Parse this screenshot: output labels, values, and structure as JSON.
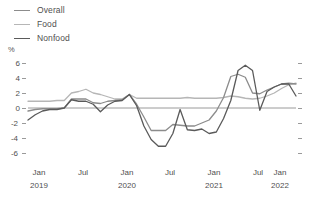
{
  "legend": {
    "position": "top-left",
    "items": [
      {
        "label": "Overall",
        "color": "#8c8c8c"
      },
      {
        "label": "Food",
        "color": "#b6b6b6"
      },
      {
        "label": "Nonfood",
        "color": "#5a5a5a"
      }
    ]
  },
  "axes": {
    "y_unit_label": "%",
    "y_ticks": [
      "6",
      "4",
      "2",
      "0",
      "-2",
      "-4",
      "-6"
    ],
    "y_tick_values": [
      6,
      4,
      2,
      0,
      -2,
      -4,
      -6
    ],
    "x_months": [
      "Jan",
      "Jul",
      "Jan",
      "Jul",
      "Jan",
      "Jul",
      "Jan"
    ],
    "x_years": [
      "2019",
      "",
      "2020",
      "",
      "2021",
      "",
      "2022"
    ]
  },
  "colors": {
    "overall": "#8c8c8c",
    "food": "#b6b6b6",
    "nonfood": "#5a5a5a",
    "axis": "#9a9a9a",
    "zero": "#9a9a9a",
    "text": "#4f4f4f"
  },
  "chart_data": {
    "type": "line",
    "title": "",
    "subtitle": "",
    "xlabel": "",
    "ylabel": "%",
    "ylim": [
      -6.6,
      6.6
    ],
    "grid": false,
    "legend_position": "top-left",
    "annotations": [],
    "x": [
      "2019-01",
      "2019-02",
      "2019-03",
      "2019-04",
      "2019-05",
      "2019-06",
      "2019-07",
      "2019-08",
      "2019-09",
      "2019-10",
      "2019-11",
      "2019-12",
      "2020-01",
      "2020-02",
      "2020-03",
      "2020-04",
      "2020-05",
      "2020-06",
      "2020-07",
      "2020-08",
      "2020-09",
      "2020-10",
      "2020-11",
      "2020-12",
      "2021-01",
      "2021-02",
      "2021-03",
      "2021-04",
      "2021-05",
      "2021-06",
      "2021-07",
      "2021-08",
      "2021-09",
      "2021-10",
      "2021-11",
      "2021-12",
      "2022-01",
      "2022-02"
    ],
    "x_tick_labels": [
      "Jan 2019",
      "Jul",
      "Jan 2020",
      "Jul",
      "Jan 2021",
      "Jul",
      "Jan 2022"
    ],
    "series": [
      {
        "name": "Overall",
        "color": "#8c8c8c",
        "values": [
          -0.4,
          -0.2,
          -0.1,
          -0.1,
          -0.1,
          0.0,
          1.2,
          1.2,
          1.2,
          0.7,
          0.6,
          0.9,
          1.0,
          1.1,
          1.8,
          0.5,
          -1.2,
          -3.0,
          -3.0,
          -3.0,
          -2.2,
          -2.3,
          -2.4,
          -2.4,
          -2.0,
          -1.6,
          -0.4,
          1.4,
          4.2,
          4.5,
          4.1,
          2.0,
          1.9,
          2.4,
          2.8,
          3.2,
          3.3,
          3.2
        ]
      },
      {
        "name": "Food",
        "color": "#b6b6b6",
        "values": [
          0.9,
          0.9,
          0.9,
          0.9,
          1.0,
          1.0,
          2.0,
          2.2,
          2.5,
          2.0,
          1.8,
          1.5,
          1.2,
          1.2,
          1.8,
          1.3,
          1.3,
          1.3,
          1.3,
          1.3,
          1.3,
          1.3,
          1.4,
          1.3,
          1.3,
          1.3,
          1.3,
          1.4,
          1.6,
          1.5,
          1.3,
          1.2,
          1.3,
          1.6,
          2.0,
          2.6,
          3.1,
          3.3
        ]
      },
      {
        "name": "Nonfood",
        "color": "#5a5a5a",
        "values": [
          -1.6,
          -0.9,
          -0.4,
          -0.2,
          -0.2,
          0.0,
          1.1,
          0.9,
          0.9,
          0.5,
          -0.5,
          0.4,
          0.9,
          1.0,
          1.8,
          0.3,
          -2.4,
          -4.2,
          -5.1,
          -5.1,
          -3.4,
          -0.2,
          -2.9,
          -3.0,
          -2.8,
          -3.4,
          -3.2,
          -1.4,
          1.0,
          5.0,
          5.7,
          5.0,
          -0.3,
          2.2,
          2.8,
          3.2,
          3.2,
          1.6
        ]
      }
    ]
  }
}
